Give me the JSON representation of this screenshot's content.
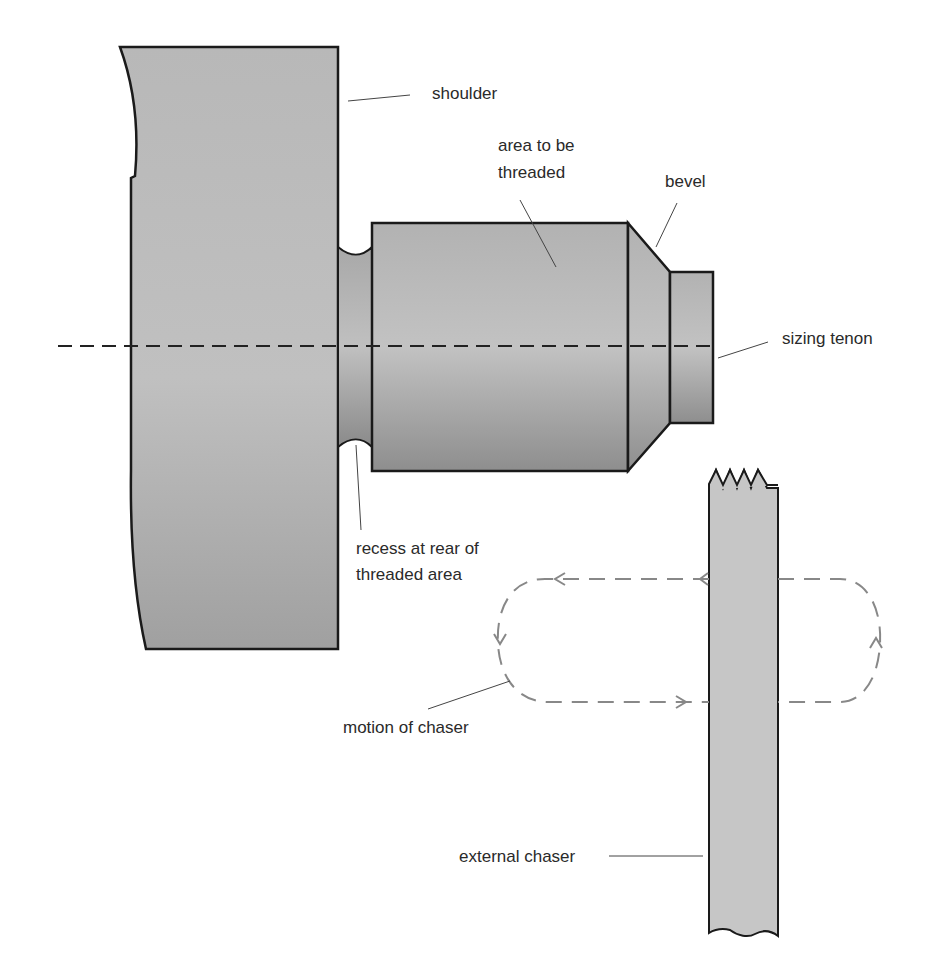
{
  "diagram": {
    "labels": {
      "shoulder": "shoulder",
      "area_to_be_threaded_1": "area to be",
      "area_to_be_threaded_2": "threaded",
      "bevel": "bevel",
      "sizing_tenon": "sizing tenon",
      "recess_1": "recess at rear of",
      "recess_2": "threaded area",
      "motion_of_chaser": "motion of chaser",
      "external_chaser": "external chaser"
    },
    "colors": {
      "workpiece_fill": "#b4b4b4",
      "chaser_fill": "#c6c6c6",
      "outline": "#1a1a1a",
      "motion_path": "#888888",
      "text": "#2a2a2a"
    }
  }
}
